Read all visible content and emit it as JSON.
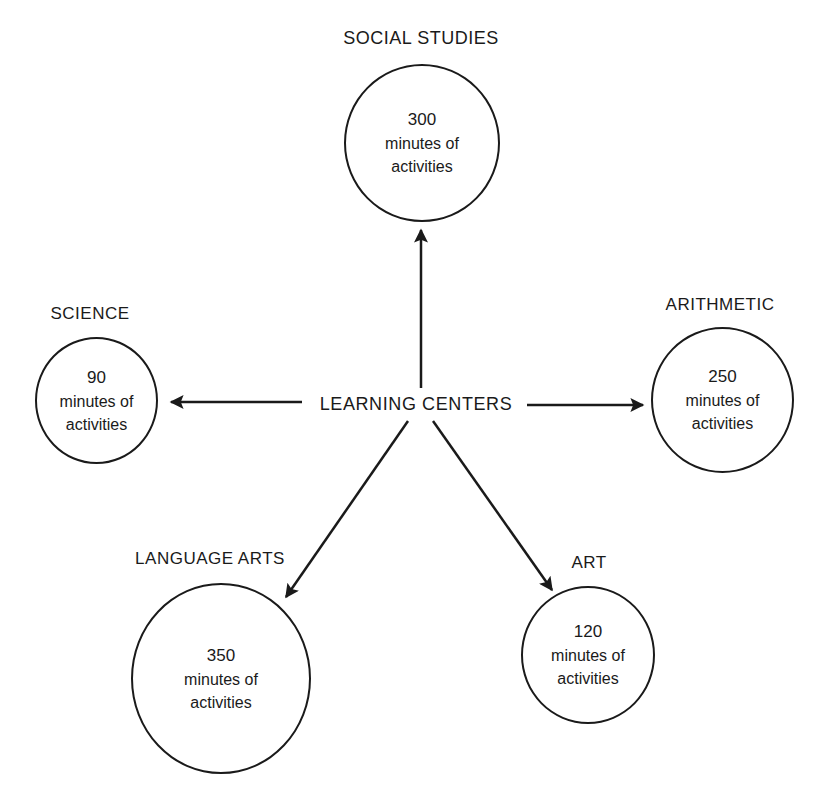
{
  "diagram": {
    "hub": {
      "label": "LEARNING CENTERS"
    },
    "centers": [
      {
        "id": "social-studies",
        "label": "SOCIAL STUDIES",
        "minutes": "300",
        "line1": "minutes of",
        "line2": "activities"
      },
      {
        "id": "science",
        "label": "SCIENCE",
        "minutes": "90",
        "line1": "minutes of",
        "line2": "activities"
      },
      {
        "id": "arithmetic",
        "label": "ARITHMETIC",
        "minutes": "250",
        "line1": "minutes of",
        "line2": "activities"
      },
      {
        "id": "language-arts",
        "label": "LANGUAGE ARTS",
        "minutes": "350",
        "line1": "minutes of",
        "line2": "activities"
      },
      {
        "id": "art",
        "label": "ART",
        "minutes": "120",
        "line1": "minutes of",
        "line2": "activities"
      }
    ]
  },
  "colors": {
    "ink": "#1a1a1a",
    "background": "#ffffff"
  }
}
